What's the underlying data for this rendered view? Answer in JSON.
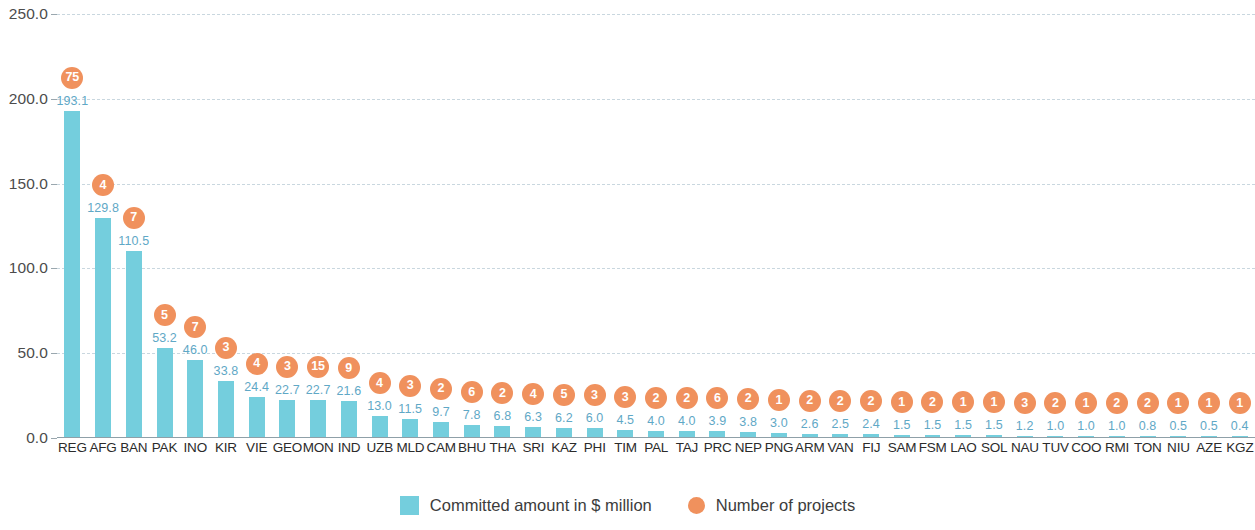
{
  "chart_data": {
    "type": "bar",
    "title": "",
    "subtitle": "",
    "xlabel": "",
    "ylabel": "",
    "ylim": [
      0,
      250
    ],
    "yticks": [
      "0.0",
      "50.0",
      "100.0",
      "150.0",
      "200.0",
      "250.0"
    ],
    "ytick_values": [
      0,
      50,
      100,
      150,
      200,
      250
    ],
    "grid": true,
    "legend_position": "bottom",
    "categories": [
      "REG",
      "AFG",
      "BAN",
      "PAK",
      "INO",
      "KIR",
      "VIE",
      "GEO",
      "MON",
      "IND",
      "UZB",
      "MLD",
      "CAM",
      "BHU",
      "THA",
      "SRI",
      "KAZ",
      "PHI",
      "TIM",
      "PAL",
      "TAJ",
      "PRC",
      "NEP",
      "PNG",
      "ARM",
      "VAN",
      "FIJ",
      "SAM",
      "FSM",
      "LAO",
      "SOL",
      "NAU",
      "TUV",
      "COO",
      "RMI",
      "TON",
      "NIU",
      "AZE",
      "KGZ"
    ],
    "series": [
      {
        "name": "Committed amount in $ million",
        "type": "bar",
        "color": "#74cedd",
        "values": [
          193.1,
          129.8,
          110.5,
          53.2,
          46.0,
          33.8,
          24.4,
          22.7,
          22.7,
          21.6,
          13.0,
          11.5,
          9.7,
          7.8,
          6.8,
          6.3,
          6.2,
          6.0,
          4.5,
          4.0,
          4.0,
          3.9,
          3.8,
          3.0,
          2.6,
          2.5,
          2.4,
          1.5,
          1.5,
          1.5,
          1.5,
          1.2,
          1.0,
          1.0,
          1.0,
          0.8,
          0.5,
          0.5,
          0.4
        ],
        "labels": [
          "193.1",
          "129.8",
          "110.5",
          "53.2",
          "46.0",
          "33.8",
          "24.4",
          "22.7",
          "22.7",
          "21.6",
          "13.0",
          "11.5",
          "9.7",
          "7.8",
          "6.8",
          "6.3",
          "6.2",
          "6.0",
          "4.5",
          "4.0",
          "4.0",
          "3.9",
          "3.8",
          "3.0",
          "2.6",
          "2.5",
          "2.4",
          "1.5",
          "1.5",
          "1.5",
          "1.5",
          "1.2",
          "1.0",
          "1.0",
          "1.0",
          "0.8",
          "0.5",
          "0.5",
          "0.4"
        ]
      },
      {
        "name": "Number of projects",
        "type": "bubble",
        "color": "#f0915d",
        "values": [
          75,
          4,
          7,
          5,
          7,
          3,
          4,
          3,
          15,
          9,
          4,
          3,
          2,
          6,
          2,
          4,
          5,
          3,
          3,
          2,
          2,
          6,
          2,
          1,
          2,
          2,
          2,
          1,
          2,
          1,
          1,
          3,
          2,
          1,
          2,
          2,
          1,
          1,
          1
        ],
        "labels": [
          "75",
          "4",
          "7",
          "5",
          "7",
          "3",
          "4",
          "3",
          "15",
          "9",
          "4",
          "3",
          "2",
          "6",
          "2",
          "4",
          "5",
          "3",
          "3",
          "2",
          "2",
          "6",
          "2",
          "1",
          "2",
          "2",
          "2",
          "1",
          "2",
          "1",
          "1",
          "3",
          "2",
          "1",
          "2",
          "2",
          "1",
          "1",
          "1"
        ]
      }
    ]
  },
  "legend": {
    "items": [
      {
        "label": "Committed amount in $ million",
        "marker": "square-swatch",
        "color": "#74cedd"
      },
      {
        "label": "Number of projects",
        "marker": "circle-swatch",
        "color": "#f0915d"
      }
    ]
  },
  "colors": {
    "bar": "#74cedd",
    "bubble": "#f0915d",
    "value_label": "#5fa8c6",
    "axis_label": "#4c4c4c",
    "gridline": "#c9d7df",
    "category_label": "#2b2b2b"
  }
}
